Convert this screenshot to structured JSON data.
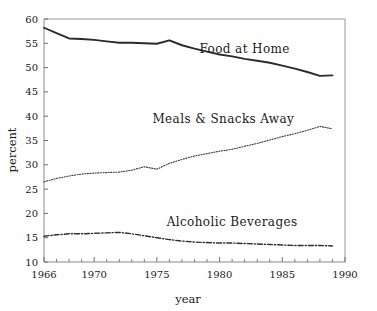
{
  "chart_data": {
    "type": "line",
    "title": "",
    "xlabel": "year",
    "ylabel": "percent",
    "xlim": [
      1966,
      1990
    ],
    "ylim": [
      10,
      60
    ],
    "grid": false,
    "legend_position": "inline-right",
    "xticks": [
      1966,
      1970,
      1975,
      1980,
      1985,
      1990
    ],
    "xtick_labels": [
      "1966",
      "1970",
      "1975",
      "1980",
      "1985",
      "1990"
    ],
    "yticks": [
      10,
      15,
      20,
      25,
      30,
      35,
      40,
      45,
      50,
      55,
      60
    ],
    "ytick_labels": [
      "10",
      "15",
      "20",
      "25",
      "30",
      "35",
      "40",
      "45",
      "50",
      "55",
      "60"
    ],
    "x": [
      1966,
      1967,
      1968,
      1969,
      1970,
      1971,
      1972,
      1973,
      1974,
      1975,
      1976,
      1977,
      1978,
      1979,
      1980,
      1981,
      1982,
      1983,
      1984,
      1985,
      1986,
      1987,
      1988,
      1989
    ],
    "series": [
      {
        "name": "Food at Home",
        "label": "Food at Home",
        "style": "solid",
        "color": "#2b2b2b",
        "width": 1.9,
        "label_x": 1982.0,
        "label_y": 53.0,
        "values": [
          58.2,
          57.1,
          56.0,
          55.9,
          55.7,
          55.4,
          55.1,
          55.1,
          55.0,
          54.9,
          55.6,
          54.6,
          53.9,
          53.3,
          52.7,
          52.3,
          51.8,
          51.4,
          51.0,
          50.4,
          49.8,
          49.1,
          48.3,
          48.4
        ]
      },
      {
        "name": "Meals & Snacks Away",
        "label": "Meals & Snacks Away",
        "style": "dotted",
        "color": "#3a3a3a",
        "width": 1.1,
        "label_x": 1980.3,
        "label_y": 38.6,
        "values": [
          26.5,
          27.2,
          27.7,
          28.1,
          28.3,
          28.4,
          28.5,
          28.9,
          29.6,
          29.1,
          30.3,
          31.1,
          31.8,
          32.3,
          32.8,
          33.2,
          33.8,
          34.4,
          35.1,
          35.8,
          36.4,
          37.1,
          37.9,
          37.4
        ]
      },
      {
        "name": "Alcoholic Beverages",
        "label": "Alcoholic Beverages",
        "style": "dashdot",
        "color": "#2f2f2f",
        "width": 1.4,
        "label_x": 1981.0,
        "label_y": 17.4,
        "values": [
          15.3,
          15.6,
          15.8,
          15.8,
          15.9,
          16.0,
          16.1,
          15.8,
          15.4,
          15.0,
          14.6,
          14.3,
          14.1,
          14.0,
          13.9,
          13.9,
          13.8,
          13.7,
          13.6,
          13.5,
          13.4,
          13.4,
          13.4,
          13.3
        ]
      }
    ]
  }
}
